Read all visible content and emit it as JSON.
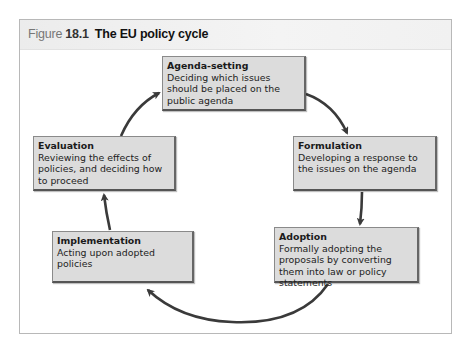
{
  "figure": {
    "label_word": "Figure",
    "number": "18.1",
    "title": "The EU policy cycle"
  },
  "stages": [
    {
      "id": "agenda-setting",
      "title": "Agenda-setting",
      "description": "Deciding which issues should be placed on the public agenda"
    },
    {
      "id": "formulation",
      "title": "Formulation",
      "description": "Developing a response to the issues on the agenda"
    },
    {
      "id": "adoption",
      "title": "Adoption",
      "description": "Formally adopting the proposals by converting them into law or policy statements"
    },
    {
      "id": "implementation",
      "title": "Implementation",
      "description": "Acting upon adopted policies"
    },
    {
      "id": "evaluation",
      "title": "Evaluation",
      "description": "Reviewing the effects of policies, and deciding how to proceed"
    }
  ],
  "flow": [
    {
      "from": "agenda-setting",
      "to": "formulation"
    },
    {
      "from": "formulation",
      "to": "adoption"
    },
    {
      "from": "adoption",
      "to": "implementation"
    },
    {
      "from": "implementation",
      "to": "evaluation"
    },
    {
      "from": "evaluation",
      "to": "agenda-setting"
    }
  ],
  "colors": {
    "box_fill": "#dcdcdc",
    "arrow": "#3a3a3a",
    "header_band": "#efefef",
    "frame_border": "#b8b8b8"
  }
}
